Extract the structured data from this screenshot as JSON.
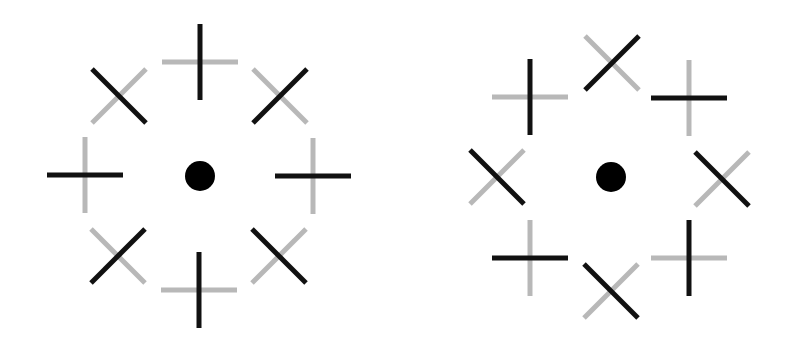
{
  "colors": {
    "background": "#ffffff",
    "dark": "#111111",
    "light": "#b8b8b8",
    "dot": "#000000"
  },
  "stroke_width": 5,
  "dot_radius": 15,
  "figures": [
    {
      "name": "left-figure",
      "center": [
        200,
        176
      ],
      "elements": [
        {
          "name": "plus-top",
          "type": "plus",
          "cx": 200,
          "cy": 62,
          "half": 38,
          "vertical": "dark",
          "horizontal": "light"
        },
        {
          "name": "x-top-left",
          "type": "x",
          "cx": 119,
          "cy": 96,
          "half": 27,
          "backslash": "dark",
          "slash": "light"
        },
        {
          "name": "x-top-right",
          "type": "x",
          "cx": 280,
          "cy": 96,
          "half": 27,
          "backslash": "light",
          "slash": "dark"
        },
        {
          "name": "plus-left",
          "type": "plus",
          "cx": 85,
          "cy": 175,
          "half": 38,
          "vertical": "light",
          "horizontal": "dark"
        },
        {
          "name": "plus-right",
          "type": "plus",
          "cx": 313,
          "cy": 176,
          "half": 38,
          "vertical": "light",
          "horizontal": "dark"
        },
        {
          "name": "x-bottom-left",
          "type": "x",
          "cx": 118,
          "cy": 256,
          "half": 27,
          "backslash": "light",
          "slash": "dark"
        },
        {
          "name": "x-bottom-right",
          "type": "x",
          "cx": 279,
          "cy": 256,
          "half": 27,
          "backslash": "dark",
          "slash": "light"
        },
        {
          "name": "plus-bottom",
          "type": "plus",
          "cx": 199,
          "cy": 290,
          "half": 38,
          "vertical": "dark",
          "horizontal": "light"
        }
      ]
    },
    {
      "name": "right-figure",
      "center": [
        611,
        177
      ],
      "elements": [
        {
          "name": "x-top",
          "type": "x",
          "cx": 612,
          "cy": 63,
          "half": 27,
          "backslash": "light",
          "slash": "dark"
        },
        {
          "name": "plus-top-left",
          "type": "plus",
          "cx": 530,
          "cy": 97,
          "half": 38,
          "vertical": "dark",
          "horizontal": "light"
        },
        {
          "name": "plus-top-right",
          "type": "plus",
          "cx": 689,
          "cy": 98,
          "half": 38,
          "vertical": "light",
          "horizontal": "dark"
        },
        {
          "name": "x-left",
          "type": "x",
          "cx": 497,
          "cy": 177,
          "half": 27,
          "backslash": "dark",
          "slash": "light"
        },
        {
          "name": "x-right",
          "type": "x",
          "cx": 722,
          "cy": 179,
          "half": 27,
          "backslash": "dark",
          "slash": "light"
        },
        {
          "name": "plus-bottom-left",
          "type": "plus",
          "cx": 530,
          "cy": 258,
          "half": 38,
          "vertical": "light",
          "horizontal": "dark"
        },
        {
          "name": "plus-bottom-right",
          "type": "plus",
          "cx": 689,
          "cy": 258,
          "half": 38,
          "vertical": "dark",
          "horizontal": "light"
        },
        {
          "name": "x-bottom",
          "type": "x",
          "cx": 611,
          "cy": 291,
          "half": 27,
          "backslash": "dark",
          "slash": "light"
        }
      ]
    }
  ]
}
